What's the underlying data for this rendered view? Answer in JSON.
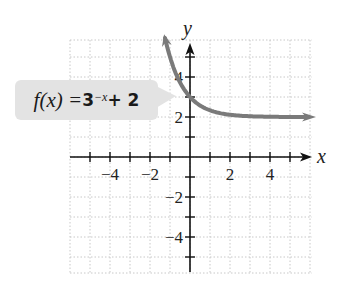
{
  "chart_data": {
    "type": "line",
    "title": "",
    "function_label": {
      "prefix": "f(x) = ",
      "base": "3",
      "exponent": "−x",
      "suffix": " + 2"
    },
    "expression": "3^(-x) + 2",
    "xlabel": "x",
    "ylabel": "y",
    "xlim": [
      -6,
      6
    ],
    "ylim": [
      -6,
      6
    ],
    "grid": true,
    "x_tick_labels": [
      {
        "value": -4,
        "text": "−4"
      },
      {
        "value": -2,
        "text": "−2"
      },
      {
        "value": 2,
        "text": "2"
      },
      {
        "value": 4,
        "text": "4"
      }
    ],
    "y_tick_labels": [
      {
        "value": 4,
        "text": "4"
      },
      {
        "value": 2,
        "text": "2"
      },
      {
        "value": -2,
        "text": "−2"
      },
      {
        "value": -4,
        "text": "−4"
      }
    ],
    "series": [
      {
        "name": "f(x) = 3^(-x) + 2",
        "x": [
          -1.25,
          -1,
          -0.5,
          0,
          0.5,
          1,
          2,
          3,
          4,
          5,
          6
        ],
        "y": [
          5.95,
          5,
          3.73,
          3,
          2.58,
          2.33,
          2.11,
          2.04,
          2.01,
          2.0,
          2.0
        ],
        "color": "#7a7a7a",
        "arrows": "both"
      }
    ],
    "asymptote": {
      "type": "horizontal",
      "y": 2
    }
  }
}
